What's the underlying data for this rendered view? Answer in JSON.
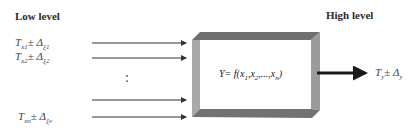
{
  "headings": {
    "low": "Low level",
    "high": "High level"
  },
  "inputs": [
    {
      "T": "T",
      "T_sub": "x1",
      "pm": "±",
      "D": "Δ",
      "D_sub": "ξ1"
    },
    {
      "T": "T",
      "T_sub": "x2",
      "pm": "±",
      "D": "Δ",
      "D_sub": "ξ2"
    },
    {
      "T": "T",
      "T_sub": "xn",
      "pm": "±",
      "D": "Δ",
      "D_sub": "ξv"
    }
  ],
  "ellipsis": ":",
  "box": {
    "formula_lhs": "Y= f(",
    "args": [
      {
        "v": "x",
        "sub": "1"
      },
      {
        "v": "x",
        "sub": "2"
      },
      {
        "v": "x",
        "sub": "n"
      }
    ],
    "sep": ",",
    "dots": "...",
    "close": ")"
  },
  "output": {
    "T": "T",
    "T_sub": "y",
    "pm": "±",
    "D": "Δ",
    "D_sub": "y"
  },
  "colors": {
    "bevel_top": "#6f6f6f",
    "bevel_left": "#a9a9a9",
    "bevel_right": "#9b9b9b",
    "bevel_bottom": "#727272",
    "arrow": "#333333",
    "output_arrow": "#1a1a1a"
  }
}
